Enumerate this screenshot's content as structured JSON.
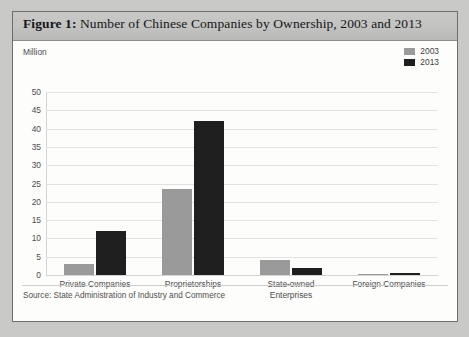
{
  "figure": {
    "label": "Figure 1:",
    "title": " Number of Chinese Companies by Ownership, 2003 and 2013",
    "unit_label": "Million",
    "source": "Source: State Administration of Industry and Commerce"
  },
  "colors": {
    "series_2003": "#9a9a9a",
    "series_2013": "#1f1f1f",
    "gridline": "#e2e2e2",
    "axis": "#d4d4d4",
    "title_band": "#c2c2c0",
    "border": "#6d6d6d",
    "text": "#4c4c4c"
  },
  "legend": {
    "position": "top-right",
    "entries": [
      {
        "label": "2003",
        "color": "#9a9a9a"
      },
      {
        "label": "2013",
        "color": "#1f1f1f"
      }
    ]
  },
  "chart_data": {
    "type": "bar",
    "title": "Figure 1: Number of Chinese Companies by Ownership, 2003 and 2013",
    "subtitle": "",
    "xlabel": "",
    "ylabel": "Million",
    "ylim": [
      0,
      50
    ],
    "ytick_step": 5,
    "yticks": [
      0,
      5,
      10,
      15,
      20,
      25,
      30,
      35,
      40,
      45,
      50
    ],
    "ytick_labels": [
      "0",
      "5",
      "10",
      "15",
      "20",
      "25",
      "30",
      "35",
      "40",
      "45",
      "50"
    ],
    "grid": true,
    "grid_axis": "y",
    "legend": [
      "2003",
      "2013"
    ],
    "categories": [
      "Private Companies",
      "Proprietorships",
      "State-owned Enterprises",
      "Foreign Companies"
    ],
    "category_lines": [
      [
        "Private Companies"
      ],
      [
        "Proprietorships"
      ],
      [
        "State-owned",
        "Enterprises"
      ],
      [
        "Foreign Companies"
      ]
    ],
    "series": [
      {
        "name": "2003",
        "color": "#9a9a9a",
        "values": [
          3.0,
          23.5,
          4.0,
          0.25
        ]
      },
      {
        "name": "2013",
        "color": "#1f1f1f",
        "values": [
          12.0,
          42.0,
          1.8,
          0.45
        ]
      }
    ],
    "annotations": [],
    "source": "Source: State Administration of Industry and Commerce"
  }
}
